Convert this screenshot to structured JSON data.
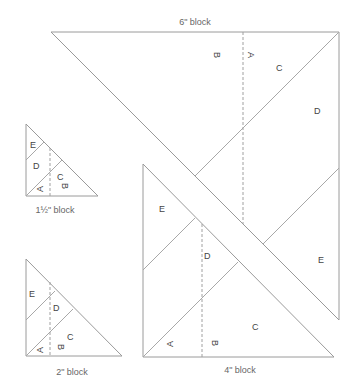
{
  "blocks": {
    "six_inch": {
      "caption": "6\" block",
      "labels": {
        "A": "A",
        "B": "B",
        "C": "C",
        "D": "D",
        "E": "E"
      }
    },
    "four_inch": {
      "caption": "4\" block",
      "labels": {
        "A": "A",
        "B": "B",
        "C": "C",
        "D": "D",
        "E": "E"
      }
    },
    "two_inch": {
      "caption": "2\" block",
      "labels": {
        "A": "A",
        "B": "B",
        "C": "C",
        "D": "D",
        "E": "E"
      }
    },
    "one_half_inch": {
      "caption": "1½\" block",
      "labels": {
        "A": "A",
        "B": "B",
        "C": "C",
        "D": "D",
        "E": "E"
      }
    }
  }
}
